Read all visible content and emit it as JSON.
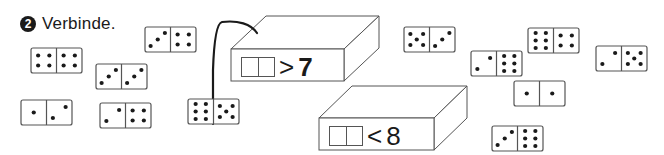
{
  "task": {
    "number": "2",
    "instruction": "Verbinde."
  },
  "colors": {
    "ink": "#1a1a1a",
    "outline": "#555555",
    "background": "#ffffff"
  },
  "boxes": [
    {
      "label_operator": ">",
      "label_value": "7",
      "front": {
        "x": 231,
        "y": 49,
        "w": 113,
        "h": 32
      },
      "depth": {
        "dx": 35,
        "dy": -33
      }
    },
    {
      "label_operator": "<",
      "label_value": "8",
      "front": {
        "x": 319,
        "y": 118,
        "w": 115,
        "h": 32
      },
      "depth": {
        "dx": 33,
        "dy": -32
      }
    }
  ],
  "connection_line": {
    "from": {
      "x": 213,
      "y": 124
    },
    "to": {
      "x": 257,
      "y": 33
    },
    "description": "line from domino 6|5 to box > 7"
  },
  "dominoes": [
    {
      "left": 4,
      "right": 4,
      "x": 31,
      "y": 48
    },
    {
      "left": 3,
      "right": 3,
      "x": 96,
      "y": 64
    },
    {
      "left": 1,
      "right": 2,
      "x": 21,
      "y": 100
    },
    {
      "left": 2,
      "right": 4,
      "x": 100,
      "y": 103
    },
    {
      "left": 3,
      "right": 4,
      "x": 145,
      "y": 27
    },
    {
      "left": 6,
      "right": 5,
      "x": 188,
      "y": 99
    },
    {
      "left": 5,
      "right": 3,
      "x": 404,
      "y": 27
    },
    {
      "left": 2,
      "right": 6,
      "x": 471,
      "y": 51
    },
    {
      "left": 6,
      "right": 4,
      "x": 528,
      "y": 28
    },
    {
      "left": 2,
      "right": 5,
      "x": 596,
      "y": 46
    },
    {
      "left": 1,
      "right": 1,
      "x": 514,
      "y": 81
    },
    {
      "left": 3,
      "right": 6,
      "x": 492,
      "y": 126
    }
  ]
}
